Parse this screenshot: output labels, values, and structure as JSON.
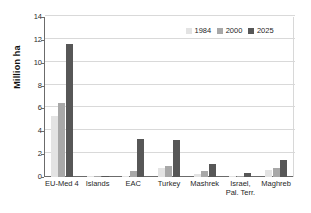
{
  "chart_data": {
    "type": "bar",
    "title": "",
    "subtitle": "",
    "xlabel": "",
    "ylabel": "Million ha",
    "ylim": [
      0,
      14
    ],
    "ytick_values": [
      0,
      2,
      4,
      6,
      8,
      10,
      12,
      14
    ],
    "ytick_labels": [
      "0",
      "2",
      "4",
      "6",
      "8",
      "10",
      "12",
      "14"
    ],
    "grid": "horizontal",
    "legend_position": "top-right",
    "categories": [
      "EU-Med 4",
      "Islands",
      "EAC",
      "Turkey",
      "Mashrek",
      "Israel, Pal. Terr.",
      "Maghreb"
    ],
    "category_lines": [
      [
        "EU-Med 4"
      ],
      [
        "Islands"
      ],
      [
        "EAC"
      ],
      [
        "Turkey"
      ],
      [
        "Mashrek"
      ],
      [
        "Israel,",
        "Pal. Terr."
      ],
      [
        "Maghreb"
      ]
    ],
    "series": [
      {
        "name": "1984",
        "color": "#e3e3e3",
        "values": [
          5.3,
          0.03,
          0.05,
          0.8,
          0.3,
          0.02,
          0.6
        ]
      },
      {
        "name": "2000",
        "color": "#a8a8a8",
        "values": [
          6.5,
          0.05,
          0.5,
          1.0,
          0.55,
          0.03,
          0.75
        ]
      },
      {
        "name": "2025",
        "color": "#575757",
        "values": [
          11.6,
          0.12,
          3.3,
          3.2,
          1.1,
          0.35,
          1.45
        ]
      }
    ]
  },
  "legend": {
    "items": [
      {
        "label": "1984"
      },
      {
        "label": "2000"
      },
      {
        "label": "2025"
      }
    ]
  },
  "axes": {
    "y_title": "Million ha"
  }
}
